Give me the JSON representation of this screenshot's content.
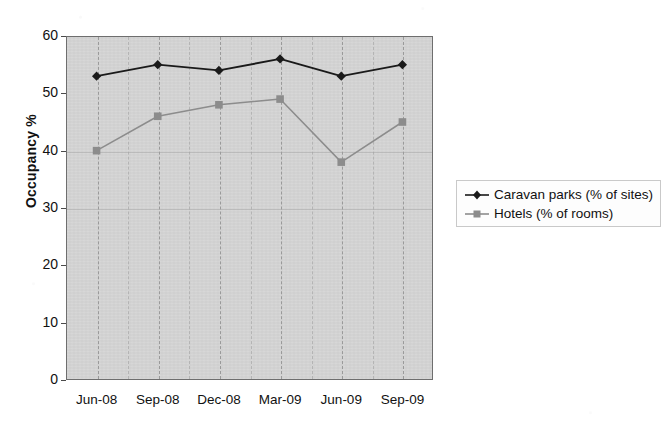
{
  "chart_data": {
    "type": "line",
    "title": "",
    "subtitle": "",
    "xlabel": "",
    "ylabel": "Occupancy %",
    "categories": [
      "Jun-08",
      "Sep-08",
      "Dec-08",
      "Mar-09",
      "Jun-09",
      "Sep-09"
    ],
    "series": [
      {
        "name": "Caravan parks (% of sites)",
        "values": [
          53,
          55,
          54,
          56,
          53,
          55
        ],
        "color": "#1a1a1a",
        "marker": "diamond"
      },
      {
        "name": "Hotels (% of rooms)",
        "values": [
          40,
          46,
          48,
          49,
          38,
          45
        ],
        "color": "#8c8c8c",
        "marker": "square"
      }
    ],
    "ylim": [
      0,
      60
    ],
    "ytick_values": [
      0,
      10,
      20,
      30,
      40,
      50,
      60
    ],
    "ytick_labels": [
      "0",
      "10",
      "20",
      "30",
      "40",
      "50",
      "60"
    ],
    "grid": "vertical-dashed",
    "legend_position": "right",
    "plot_background": "#d4d4d4",
    "page_background": "#ffffff"
  },
  "legend": {
    "entries": [
      {
        "label": "Caravan parks (% of sites)",
        "marker": "diamond-marker",
        "color": "#1a1a1a"
      },
      {
        "label": "Hotels (% of rooms)",
        "marker": "square-marker",
        "color": "#8c8c8c"
      }
    ]
  }
}
